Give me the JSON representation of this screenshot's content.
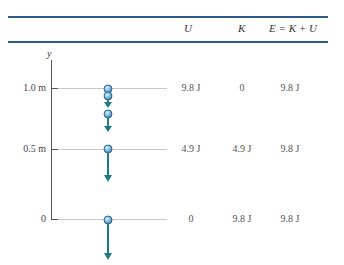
{
  "table": {
    "headers": [
      "U",
      "K",
      "E = K + U"
    ],
    "rows": [
      {
        "y_label": "1.0 m",
        "U": "9.8 J",
        "K": "0",
        "E": "9.8 J"
      },
      {
        "y_label": "0.5 m",
        "U": "4.9 J",
        "K": "4.9 J",
        "E": "9.8 J"
      },
      {
        "y_label": "0",
        "U": "0",
        "K": "9.8 J",
        "E": "9.8 J"
      }
    ]
  },
  "axis": {
    "label": "y"
  },
  "colors": {
    "rule": "#2c5a8c",
    "arrow": "#1f7a80",
    "ball": "#7fb6d9",
    "ball_edge": "#2d6a99",
    "gridline": "#c8c8c8",
    "axis": "#555555"
  }
}
